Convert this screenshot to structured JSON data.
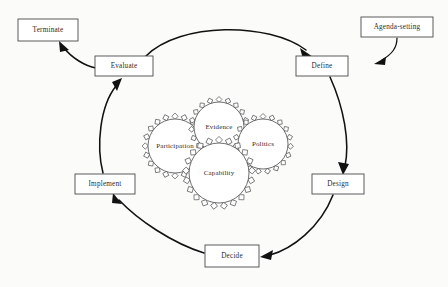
{
  "diagram": {
    "background_color": "#fbfbfa",
    "line_color": "#111111",
    "box_stroke_color": "#4a4a4a",
    "text_color": "#2b2b2b"
  },
  "nodes": [
    {
      "id": "terminate",
      "label": "Terminate",
      "x": 48,
      "y": 30,
      "w": 60,
      "h": 22
    },
    {
      "id": "agenda-setting",
      "label": "Agenda-setting",
      "x": 397,
      "y": 27,
      "w": 72,
      "h": 20
    },
    {
      "id": "evaluate",
      "label": "Evaluate",
      "x": 124,
      "y": 66,
      "w": 58,
      "h": 20
    },
    {
      "id": "define",
      "label": "Define",
      "x": 322,
      "y": 66,
      "w": 52,
      "h": 20
    },
    {
      "id": "design",
      "label": "Design",
      "x": 338,
      "y": 184,
      "w": 52,
      "h": 20
    },
    {
      "id": "implement",
      "label": "Implement",
      "x": 105,
      "y": 184,
      "w": 60,
      "h": 20
    },
    {
      "id": "decide",
      "label": "Decide",
      "x": 232,
      "y": 256,
      "w": 54,
      "h": 22
    }
  ],
  "gears": [
    {
      "id": "participation",
      "label": "Participation",
      "cx": 175,
      "cy": 146,
      "r": 27,
      "teeth": 20
    },
    {
      "id": "evidence",
      "label": "Evidence",
      "cx": 219,
      "cy": 127,
      "r": 25,
      "teeth": 19
    },
    {
      "id": "politics",
      "label": "Politics",
      "cx": 263,
      "cy": 144,
      "r": 25,
      "teeth": 19
    },
    {
      "id": "capability",
      "label": "Capability",
      "cx": 219,
      "cy": 173,
      "r": 30,
      "teeth": 21
    }
  ],
  "flows": [
    {
      "id": "agenda-to-define",
      "from": "agenda-setting",
      "to": "define"
    },
    {
      "id": "evaluate-to-define",
      "from": "evaluate",
      "to": "define"
    },
    {
      "id": "evaluate-to-terminate",
      "from": "evaluate",
      "to": "terminate"
    },
    {
      "id": "define-to-design",
      "from": "define",
      "to": "design"
    },
    {
      "id": "design-to-decide",
      "from": "design",
      "to": "decide"
    },
    {
      "id": "decide-to-implement",
      "from": "decide",
      "to": "implement"
    },
    {
      "id": "implement-to-evaluate",
      "from": "implement",
      "to": "evaluate"
    }
  ]
}
